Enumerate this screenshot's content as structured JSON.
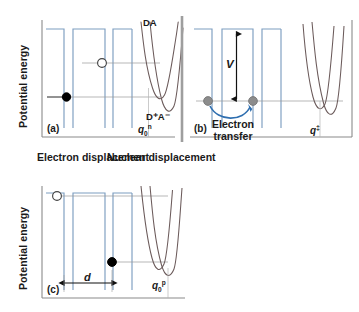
{
  "figure": {
    "axis_y_label": "Potential energy",
    "axis_x_left_label": "Electron displacement",
    "axis_x_right_label": "Nuclear displacement",
    "colors": {
      "well_line": "#7d9ec0",
      "parabola": "#6b5a5a",
      "level_line": "#9a9a9a",
      "electron_fill": "#000000",
      "hole_fill": "#ffffff",
      "transfer_marker": "#8c8c8c",
      "transfer_arrow": "#2f6fb0",
      "axis": "#8a8a8a",
      "divider": "#9e9e9e",
      "background": "#ffffff"
    }
  },
  "panels": [
    {
      "id": "(a)",
      "name": "reactant-state",
      "q_label": {
        "base": "q",
        "sub": "0",
        "sup": "n"
      },
      "curve_labels": [
        {
          "name": "donor-acceptor",
          "text": "DA"
        },
        {
          "name": "charge-separated",
          "text": "D⁺A⁻"
        }
      ],
      "particles": [
        {
          "name": "hole",
          "kind": "open-circle"
        },
        {
          "name": "electron",
          "kind": "filled-circle"
        }
      ]
    },
    {
      "id": "(b)",
      "name": "transition-state",
      "q_label": {
        "base": "q",
        "sub": "",
        "sup": "‡"
      },
      "coupling_label": "V",
      "transfer_label_line1": "Electron",
      "transfer_label_line2": "transfer",
      "particles": [
        {
          "name": "electron-left",
          "kind": "gray-circle"
        },
        {
          "name": "electron-right",
          "kind": "gray-circle"
        }
      ]
    },
    {
      "id": "(c)",
      "name": "product-state",
      "q_label": {
        "base": "q",
        "sub": "0",
        "sup": "p"
      },
      "distance_label": "d",
      "particles": [
        {
          "name": "hole",
          "kind": "open-circle"
        },
        {
          "name": "electron",
          "kind": "filled-circle"
        }
      ]
    }
  ]
}
